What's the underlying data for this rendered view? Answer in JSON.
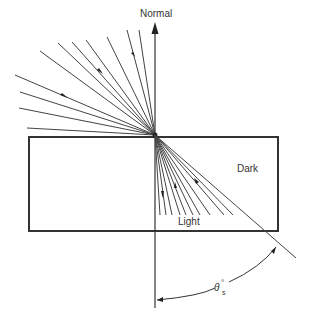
{
  "labels": {
    "normal": "Normal",
    "dark": "Dark",
    "light": "Light",
    "angle_symbol": "θ",
    "angle_superscript": "°",
    "angle_subscript": "s"
  },
  "colors": {
    "line": "#333333",
    "background": "#ffffff"
  },
  "geometry": {
    "focus": [
      155,
      135
    ],
    "rectangle": {
      "x": 29,
      "y": 137,
      "w": 249,
      "h": 94
    },
    "normal_line": {
      "x": 155,
      "y_top": 24,
      "y_bottom": 308
    },
    "incident_ray_ends": [
      [
        127,
        30
      ],
      [
        139,
        30
      ],
      [
        107,
        37
      ],
      [
        86,
        40
      ],
      [
        72,
        42
      ],
      [
        58,
        43
      ],
      [
        40,
        51
      ],
      [
        15,
        75
      ],
      [
        20,
        92
      ],
      [
        19,
        108
      ],
      [
        27,
        128
      ]
    ],
    "refracted_ray_ends": [
      [
        160,
        215
      ],
      [
        166,
        215
      ],
      [
        172,
        215
      ],
      [
        180,
        215
      ],
      [
        186,
        215
      ],
      [
        193,
        215
      ],
      [
        200,
        215
      ],
      [
        210,
        215
      ],
      [
        224,
        215
      ],
      [
        233,
        215
      ]
    ],
    "critical_ray_end": [
      296,
      258
    ]
  }
}
